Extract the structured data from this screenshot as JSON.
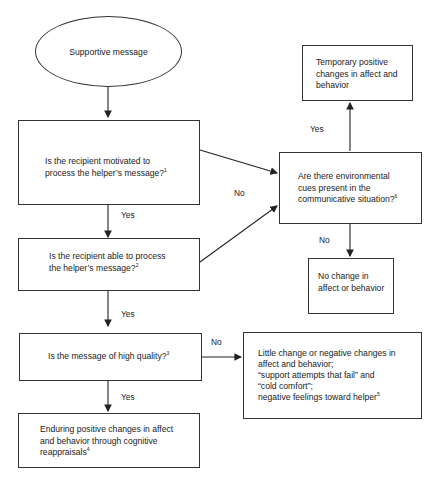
{
  "nodes": {
    "start": {
      "text": "Supportive message"
    },
    "motivated": {
      "line1": "Is the recipient motivated to",
      "line2": "process the helper’s message?",
      "note": "1"
    },
    "able": {
      "line1": "Is the recipient able to process",
      "line2": "the helper’s message?",
      "note": "2"
    },
    "quality": {
      "line1": "Is the message of high quality?",
      "note": "3"
    },
    "enduring": {
      "line1": "Enduring positive changes in affect",
      "line2": "and behavior through cognitive",
      "line3": "reappraisals",
      "note": "4"
    },
    "environmental": {
      "line1": "Are there environmental",
      "line2": "cues present in the",
      "line3": "communicative situation?",
      "note": "6"
    },
    "temporary": {
      "line1": "Temporary positive",
      "line2": "changes in affect and",
      "line3": "behavior"
    },
    "no_change": {
      "line1": "No change in",
      "line2": "affect or behavior"
    },
    "little_change": {
      "line1": "Little change or negative changes in",
      "line2": "affect and behavior;",
      "line3": "“support attempts that fail” and",
      "line4": "“cold comfort”;",
      "line5": "negative feelings toward helper",
      "note": "5"
    }
  },
  "edges": {
    "motivated_yes": "Yes",
    "motivated_no": "No",
    "able_yes": "Yes",
    "quality_yes": "Yes",
    "quality_no": "No",
    "env_yes": "Yes",
    "env_no": "No"
  },
  "colors": {
    "line": "#222222",
    "border": "#333333",
    "background": "#ffffff"
  }
}
